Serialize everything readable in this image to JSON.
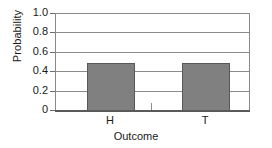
{
  "chart_data": {
    "type": "bar",
    "title": "",
    "subtitle": "",
    "xlabel": "Outcome",
    "ylabel": "Probability",
    "categories": [
      "H",
      "T"
    ],
    "values": [
      0.49,
      0.49
    ],
    "series": [
      {
        "name": "Probability",
        "values": [
          0.49,
          0.49
        ]
      }
    ],
    "ylim": [
      0,
      1.0
    ],
    "ytick_values": [
      1.0,
      0.8,
      0.6,
      0.4,
      0.2,
      0
    ],
    "ytick_labels": [
      "1.0",
      "0.8",
      "0.6",
      "0.4",
      "0.2",
      "0"
    ],
    "xtick_labels": [
      "H",
      "T"
    ],
    "grid": "horizontal",
    "legend": "none",
    "annotations": [],
    "colors": {
      "bar_fill": "#808080",
      "bar_border": "#585858",
      "grid": "#8a8a8a",
      "axis": "#5a5a5a",
      "text": "#1a1a1a",
      "background": "#ffffff"
    }
  },
  "axes": {
    "y": {
      "title": "Probability",
      "ticks": [
        {
          "label": "1.0",
          "value": 1.0
        },
        {
          "label": "0.8",
          "value": 0.8
        },
        {
          "label": "0.6",
          "value": 0.6
        },
        {
          "label": "0.4",
          "value": 0.4
        },
        {
          "label": "0.2",
          "value": 0.2
        },
        {
          "label": "0",
          "value": 0
        }
      ]
    },
    "x": {
      "title": "Outcome",
      "ticks": [
        {
          "label": "H",
          "value": 0.49
        },
        {
          "label": "T",
          "value": 0.49
        }
      ]
    }
  }
}
